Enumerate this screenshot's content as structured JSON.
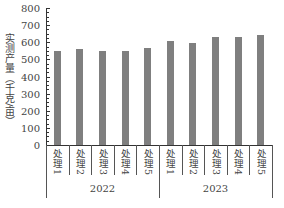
{
  "chart_data": {
    "type": "bar",
    "title": "",
    "xlabel": "",
    "ylabel": "实测产量（千克/亩）",
    "ylim": [
      0,
      800
    ],
    "yticks": [
      0,
      100,
      200,
      300,
      400,
      500,
      600,
      700,
      800
    ],
    "grid": false,
    "legend": null,
    "groups": [
      "2022",
      "2023"
    ],
    "categories": [
      "处理1",
      "处理2",
      "处理3",
      "处理4",
      "处理5",
      "处理1",
      "处理2",
      "处理3",
      "处理4",
      "处理5"
    ],
    "category_group": [
      "2022",
      "2022",
      "2022",
      "2022",
      "2022",
      "2023",
      "2023",
      "2023",
      "2023",
      "2023"
    ],
    "values": [
      550,
      558,
      550,
      548,
      565,
      605,
      598,
      632,
      628,
      640
    ],
    "bar_color": "#7f7f7f"
  },
  "labels": {
    "ylabel": "实测产量（千克/亩）",
    "yticks": [
      "0",
      "100",
      "200",
      "300",
      "400",
      "500",
      "600",
      "700",
      "800"
    ],
    "cats": [
      "处理1",
      "处理2",
      "处理3",
      "处理4",
      "处理5",
      "处理1",
      "处理2",
      "处理3",
      "处理4",
      "处理5"
    ],
    "groups": [
      "2022",
      "2023"
    ]
  }
}
